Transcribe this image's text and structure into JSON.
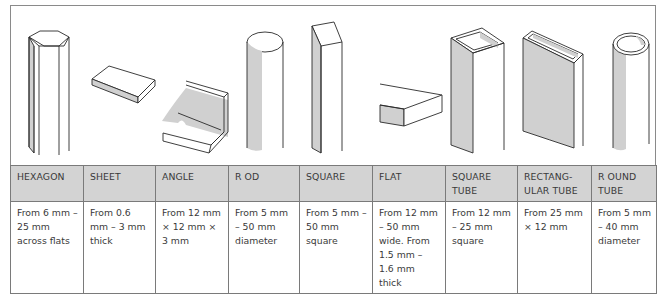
{
  "figure": {
    "shapes": [
      {
        "id": "hexagon",
        "icon": "hexagon-bar-icon"
      },
      {
        "id": "sheet",
        "icon": "sheet-icon"
      },
      {
        "id": "angle",
        "icon": "angle-section-icon"
      },
      {
        "id": "rod",
        "icon": "round-rod-icon"
      },
      {
        "id": "square",
        "icon": "square-bar-icon"
      },
      {
        "id": "flat",
        "icon": "flat-bar-icon"
      },
      {
        "id": "square_tube",
        "icon": "square-tube-icon"
      },
      {
        "id": "rectangular_tube",
        "icon": "rectangular-tube-icon"
      },
      {
        "id": "round_tube",
        "icon": "round-tube-icon"
      }
    ],
    "colors": {
      "outline": "#2a2a2a",
      "shade": "#cfcfcf",
      "header_bg": "#d3d3d3",
      "border": "#7a7a7a"
    }
  },
  "table": {
    "headers": [
      "HEXAGON",
      "SHEET",
      "ANGLE",
      "R OD",
      "SQUARE",
      "FLAT",
      "SQUARE TUBE",
      "RECTANG-ULAR TUBE",
      "R OUND TUBE"
    ],
    "sizes": [
      "From 6 mm – 25 mm across flats",
      "From 0.6 mm – 3 mm thick",
      "From 12 mm × 12 mm × 3 mm",
      "From 5 mm – 50 mm diameter",
      "From 5 mm – 50 mm square",
      "From 12 mm – 50 mm wide. From 1.5 mm – 1.6 mm thick",
      "From 12 mm – 25 mm square",
      "From 25 mm × 12 mm",
      "From 5 mm – 40 mm diameter"
    ]
  }
}
